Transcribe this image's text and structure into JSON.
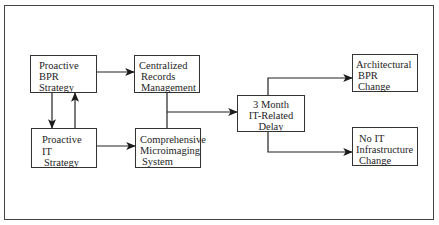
{
  "diagram": {
    "nodes": {
      "proactive_bpr": {
        "lines": [
          "Proactive",
          "BPR",
          "Strategy"
        ]
      },
      "proactive_it": {
        "lines": [
          "Proactive",
          "IT",
          "Strategy"
        ]
      },
      "centralized_records": {
        "lines": [
          "Centralized",
          "Records",
          "Management"
        ]
      },
      "comprehensive_microimaging": {
        "lines": [
          "Comprehensive",
          "Microimaging",
          "System"
        ]
      },
      "it_delay": {
        "lines": [
          "3 Month",
          "IT-Related",
          "Delay"
        ]
      },
      "architectural_bpr": {
        "lines": [
          "Architectural",
          "BPR",
          "Change"
        ]
      },
      "no_it_infrastructure": {
        "lines": [
          "No IT",
          "Infrastructure",
          "Change"
        ]
      }
    },
    "edges": [
      {
        "from": "Proactive BPR Strategy",
        "to": "Centralized Records Management"
      },
      {
        "from": "Proactive BPR Strategy",
        "to": "Proactive IT Strategy"
      },
      {
        "from": "Proactive IT Strategy",
        "to": "Proactive BPR Strategy"
      },
      {
        "from": "Proactive IT Strategy",
        "to": "Comprehensive Microimaging System"
      },
      {
        "from": "Centralized Records Management + Comprehensive Microimaging System",
        "to": "3 Month IT-Related Delay"
      },
      {
        "from": "3 Month IT-Related Delay",
        "to": "Architectural BPR Change"
      },
      {
        "from": "3 Month IT-Related Delay",
        "to": "No IT Infrastructure Change"
      }
    ]
  }
}
